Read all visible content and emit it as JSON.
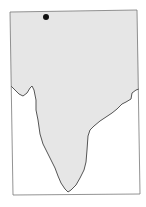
{
  "map": {
    "subject": "Indian subcontinent outline",
    "land_color": "#e6e6e6",
    "outline_color": "#555555",
    "frame_color": "#777777",
    "markers": [
      {
        "name": "location-marker",
        "x": 46,
        "y": 17,
        "r": 3,
        "color": "#111111"
      }
    ]
  }
}
